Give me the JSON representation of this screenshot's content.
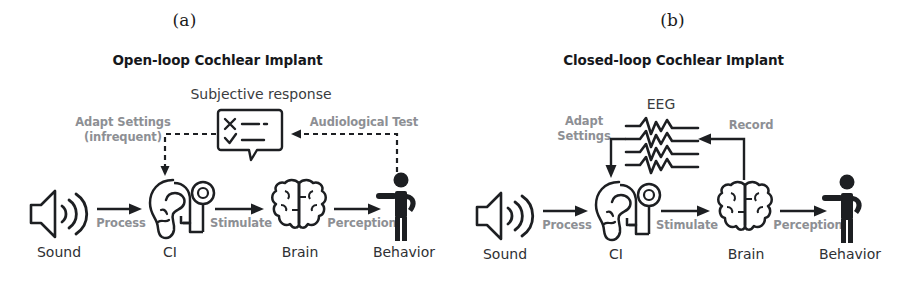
{
  "figure": {
    "panels": [
      {
        "caption": "(a)",
        "title": "Open-loop Cochlear Implant",
        "top_label": "Subjective response",
        "nodes": [
          {
            "id": "sound",
            "label": "Sound",
            "icon": "speaker-icon"
          },
          {
            "id": "ci",
            "label": "CI",
            "icon": "ear-implant-icon"
          },
          {
            "id": "brain",
            "label": "Brain",
            "icon": "brain-icon"
          },
          {
            "id": "behavior",
            "label": "Behavior",
            "icon": "person-icon"
          }
        ],
        "edges": [
          {
            "id": "process",
            "label": "Process",
            "style": "solid"
          },
          {
            "id": "stimulate",
            "label": "Stimulate",
            "style": "solid"
          },
          {
            "id": "perception",
            "label": "Perception",
            "style": "solid"
          },
          {
            "id": "audiological-test",
            "label": "Audiological Test",
            "style": "dashed"
          },
          {
            "id": "adapt-settings",
            "label_line1": "Adapt Settings",
            "label_line2": "(infrequent)",
            "style": "dashed"
          }
        ],
        "feedback_icon": "survey-bubble-icon"
      },
      {
        "caption": "(b)",
        "title": "Closed-loop Cochlear Implant",
        "top_label": "EEG",
        "nodes": [
          {
            "id": "sound",
            "label": "Sound",
            "icon": "speaker-icon"
          },
          {
            "id": "ci",
            "label": "CI",
            "icon": "ear-implant-icon"
          },
          {
            "id": "brain",
            "label": "Brain",
            "icon": "brain-icon"
          },
          {
            "id": "behavior",
            "label": "Behavior",
            "icon": "person-icon"
          }
        ],
        "edges": [
          {
            "id": "process",
            "label": "Process",
            "style": "solid"
          },
          {
            "id": "stimulate",
            "label": "Stimulate",
            "style": "solid"
          },
          {
            "id": "perception",
            "label": "Perception",
            "style": "solid"
          },
          {
            "id": "record",
            "label": "Record",
            "style": "solid"
          },
          {
            "id": "adapt-settings",
            "label_line1": "Adapt",
            "label_line2": "Settings",
            "style": "solid"
          }
        ],
        "feedback_icon": "eeg-waveform-icon"
      }
    ]
  },
  "colors": {
    "stroke": "#1d1f22",
    "edge_label": "#8d8f94",
    "node_label": "#2e3033",
    "background": "#ffffff"
  }
}
